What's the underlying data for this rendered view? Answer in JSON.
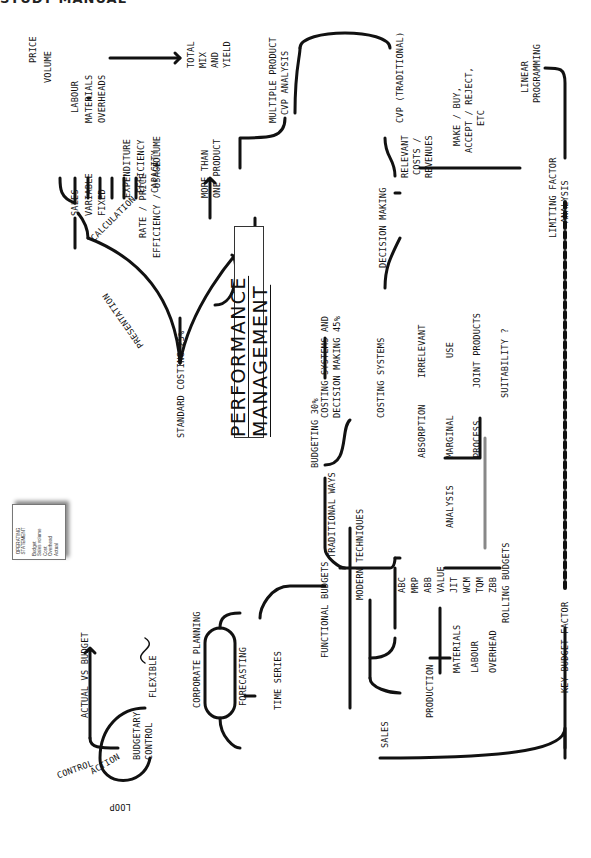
{
  "header": {
    "partial_text": "STUDY MANUAL"
  },
  "center": {
    "title": "PERFORMANCE MANAGEMENT"
  },
  "standard_costing": {
    "label": "STANDARD COSTING 25%",
    "presentation": "PRESENTATION",
    "calculation": "CALCULATION",
    "operating_statement": {
      "heading": [
        "OPERATING",
        "STATEMENT"
      ],
      "rows": [
        "Budget",
        "Sales volume",
        "Cost",
        "Overhead",
        "Actual"
      ],
      "markers": [
        "X",
        "X"
      ]
    },
    "sales": {
      "label": "SALES",
      "children": [
        "PRICE",
        "VOLUME"
      ]
    },
    "variable": {
      "label": "VARIABLE",
      "children": [
        "LABOUR",
        "MATERIALS",
        "OVERHEADS"
      ]
    },
    "variable_outcomes": [
      "RATE / PRICE",
      "EFFICIENCY / USAGE"
    ],
    "fixed": {
      "label": "FIXED",
      "children": [
        "EXPENDITURE",
        "EFFICIENCY",
        "CAPACITY"
      ],
      "volume_label": "VOLUME"
    },
    "total_mix_yield": [
      "TOTAL",
      "MIX",
      "AND",
      "YIELD"
    ],
    "abc_blocks": [
      "A",
      "B",
      "C"
    ],
    "more_than_one_product": [
      "MORE THAN",
      "ONE PRODUCT"
    ]
  },
  "costing_decision": {
    "label": [
      "COSTING SYSTEMS AND",
      "DECISION MAKING 45%"
    ],
    "decision_making": "DECISION MAKING",
    "costing_systems": "COSTING SYSTEMS",
    "systems": [
      "ABSORPTION",
      "MARGINAL",
      "PROCESS"
    ],
    "links": [
      "IRRELEVANT",
      "USE",
      "JOINT PRODUCTS",
      "SUITABILITY ?"
    ],
    "analysis": "ANALYSIS",
    "relevant": [
      "RELEVANT",
      "COSTS /",
      "REVENUES"
    ],
    "cvp_traditional": "CVP (TRADITIONAL)",
    "multiple_product_cvp": [
      "MULTIPLE PRODUCT",
      "CVP ANALYSIS"
    ],
    "make_buy": [
      "MAKE / BUY,",
      "ACCEPT / REJECT,",
      "ETC"
    ],
    "limiting_factor": [
      "LIMITING FACTOR",
      "ANALYSIS"
    ],
    "linear_programming": [
      "LINEAR",
      "PROGRAMMING"
    ]
  },
  "budgeting": {
    "label": "BUDGETING 30%",
    "traditional_ways": "TRADITIONAL WAYS",
    "modern_techniques": "MODERN TECHNIQUES",
    "techniques": [
      "ABC",
      "MRP",
      "ABB",
      "VALUE",
      "JIT",
      "WCM",
      "TQM",
      "ZBB",
      "ROLLING BUDGETS"
    ],
    "functional_budgets": "FUNCTIONAL BUDGETS",
    "sales": "SALES",
    "production": "PRODUCTION",
    "production_children": [
      "MATERIALS",
      "LABOUR",
      "OVERHEAD"
    ],
    "key_budget_factor": "KEY BUDGET FACTOR",
    "corporate_planning": "CORPORATE PLANNING",
    "forecasting": "FORECASTING",
    "time_series": "TIME SERIES",
    "budgetary_control": [
      "BUDGETARY",
      "CONTROL"
    ],
    "actual_vs_budget": "ACTUAL VS BUDGET",
    "flexible": "FLEXIBLE",
    "control_loop": [
      "CONTROL",
      "ACTION",
      "LOOP"
    ]
  }
}
